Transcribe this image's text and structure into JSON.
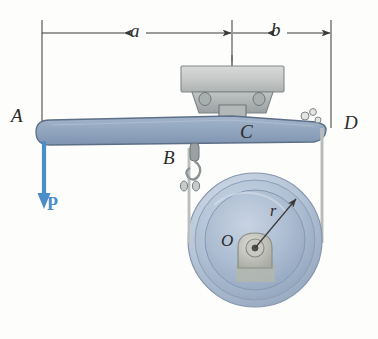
{
  "figure": {
    "type": "engineering-statics-diagram"
  },
  "labels": {
    "point_a": "A",
    "point_b": "B",
    "point_c": "C",
    "point_d": "D",
    "point_o": "O",
    "radius": "r",
    "force": "P",
    "dim_a": "a",
    "dim_b": "b"
  },
  "dimensions": {
    "a": {
      "label": "a",
      "from_x": 42,
      "to_x": 232,
      "y": 33
    },
    "b": {
      "label": "b",
      "from_x": 232,
      "to_x": 331,
      "y": 33
    }
  },
  "geometry": {
    "beam": {
      "left_x": 36,
      "right_x": 326,
      "top_y": 118,
      "bottom_y": 145
    },
    "pulley": {
      "center_x": 255,
      "center_y": 240,
      "outer_radius": 67,
      "rim_radius": 60,
      "face_radius": 50,
      "hub_radius": 12
    },
    "cable_left_x": 189,
    "cable_right_x": 322,
    "force_arrow": {
      "x": 44,
      "from_y": 141,
      "to_y": 208
    }
  },
  "colors": {
    "beam_fill": "#8fa3bd",
    "beam_edge": "#5d6f87",
    "force_blue": "#4a8dc8",
    "pulley_light": "#c3cfdf",
    "pulley_mid": "#a8bacf",
    "pulley_dark": "#8ea3bc",
    "bracket_gray": "#b9bcbb",
    "bracket_dark": "#8d9294",
    "line_black": "#3a3a3a",
    "cable_gray": "#c9cbc8",
    "background": "#fdfdfb"
  }
}
